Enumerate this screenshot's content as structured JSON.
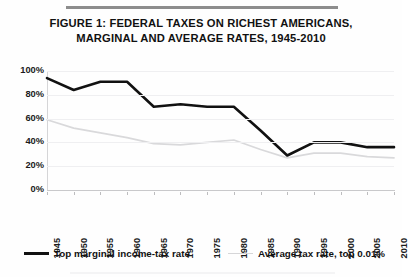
{
  "figure": {
    "title_line1": "FIGURE 1: FEDERAL TAXES ON RICHEST AMERICANS,",
    "title_line2": "MARGINAL AND AVERAGE RATES, 1945-2010"
  },
  "colors": {
    "marginal_line": "#111111",
    "average_line": "#d9d9db",
    "gridline": "#efeff1",
    "text": "#1b1b1b",
    "rule": "#8d8d8d"
  },
  "legend": {
    "position": "bottom",
    "entries": [
      {
        "label": "Top marginal income-tax rate",
        "style": "thick-black"
      },
      {
        "label": "Average tax rate, top 0.01%",
        "style": "thin-gray"
      }
    ]
  },
  "axes": {
    "ylabels": [
      "100%",
      "80%",
      "60%",
      "40%",
      "20%",
      "0%"
    ],
    "yvalues": [
      100,
      80,
      60,
      40,
      20,
      0
    ],
    "xlabels": [
      "1945",
      "1950",
      "1955",
      "1960",
      "1965",
      "1970",
      "1975",
      "1980",
      "1985",
      "1990",
      "1995",
      "2000",
      "2005",
      "2010"
    ]
  },
  "chart_data": {
    "type": "line",
    "title": "FIGURE 1: FEDERAL TAXES ON RICHEST AMERICANS, MARGINAL AND AVERAGE RATES, 1945-2010",
    "xlabel": "",
    "ylabel": "",
    "xlim": [
      1945,
      2010
    ],
    "ylim": [
      0,
      100
    ],
    "ytick_labels": [
      "0%",
      "20%",
      "40%",
      "60%",
      "80%",
      "100%"
    ],
    "yticks": [
      0,
      20,
      40,
      60,
      80,
      100
    ],
    "grid": true,
    "legend_position": "bottom",
    "categories": [
      1945,
      1950,
      1955,
      1960,
      1965,
      1970,
      1975,
      1980,
      1985,
      1990,
      1995,
      2000,
      2005,
      2010
    ],
    "series": [
      {
        "name": "Top marginal income-tax rate",
        "color": "#111111",
        "width": "thick",
        "values": [
          94,
          84,
          91,
          91,
          70,
          72,
          70,
          70,
          50,
          29,
          40,
          40,
          36,
          36
        ]
      },
      {
        "name": "Average tax rate, top 0.01%",
        "color": "#d9d9db",
        "width": "thin",
        "values": [
          59,
          52,
          48,
          44,
          39,
          38,
          40,
          42,
          34,
          27,
          31,
          31,
          28,
          27
        ]
      }
    ]
  }
}
